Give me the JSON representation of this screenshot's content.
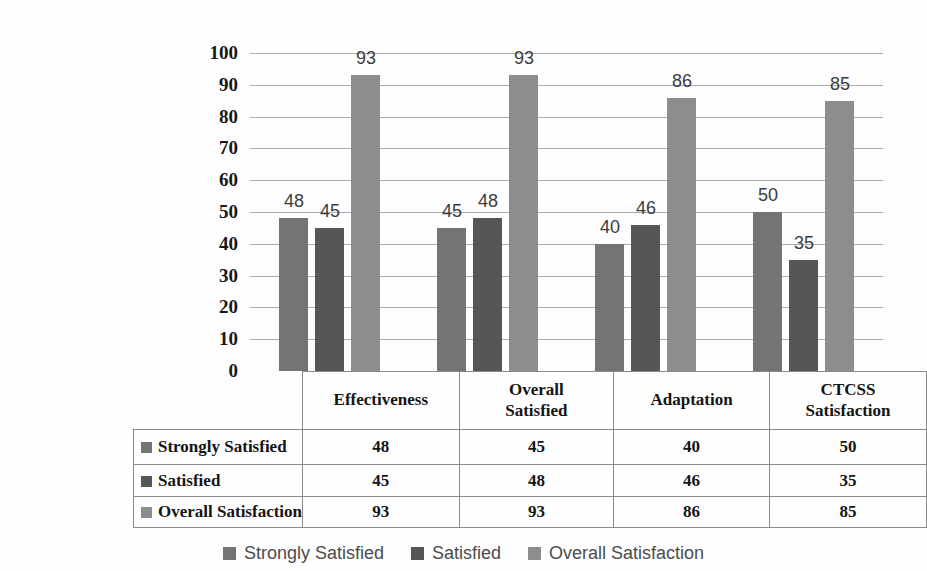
{
  "chart_data": {
    "type": "bar",
    "title": "",
    "categories": [
      "Effectiveness",
      "Overall Satisfied",
      "Adaptation",
      "CTCSS Satisfaction"
    ],
    "series": [
      {
        "name": "Strongly Satisfied",
        "values": [
          48,
          45,
          40,
          50
        ]
      },
      {
        "name": "Satisfied",
        "values": [
          45,
          48,
          46,
          35
        ]
      },
      {
        "name": "Overall Satisfaction",
        "values": [
          93,
          93,
          86,
          85
        ]
      }
    ],
    "ylim": [
      0,
      100
    ],
    "yticks": [
      0,
      10,
      20,
      30,
      40,
      50,
      60,
      70,
      80,
      90,
      100
    ],
    "grid": true,
    "show_data_labels": true,
    "legend_position": "bottom",
    "data_table": {
      "columns": [
        "Effectiveness",
        "Overall Satisfied",
        "Adaptation",
        "CTCSS Satisfaction"
      ],
      "rows": [
        {
          "label": "Strongly Satisfied",
          "values": [
            48,
            45,
            40,
            50
          ]
        },
        {
          "label": "Satisfied",
          "values": [
            45,
            48,
            46,
            35
          ]
        },
        {
          "label": "Overall Satisfaction",
          "values": [
            93,
            93,
            86,
            85
          ]
        }
      ]
    }
  },
  "style": {
    "series_colors": [
      "#747474",
      "#565656",
      "#8d8d8d"
    ],
    "gridline_color": "#ababab",
    "table_border_color": "#8a8a8a",
    "axis_text_color": "#181818",
    "data_label_color": "#3c3c3c",
    "table_text_color": "#141414",
    "legend_text_color": "#4c4c4c",
    "background": "#fefefe"
  }
}
